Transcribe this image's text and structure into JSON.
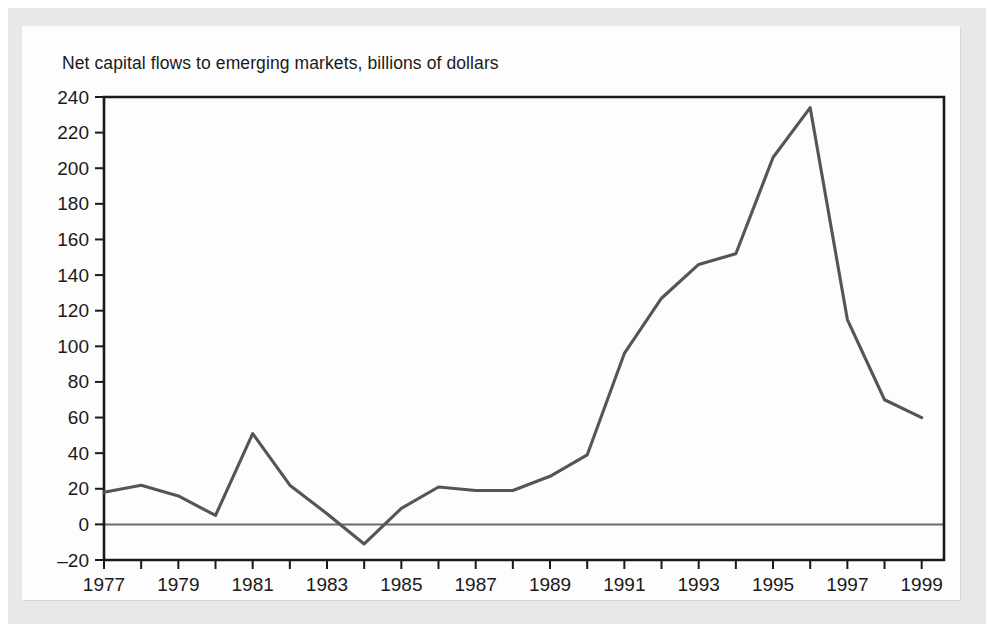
{
  "chart_data": {
    "type": "line",
    "title": "Net capital flows to emerging markets, billions of dollars",
    "xlabel": "",
    "ylabel": "",
    "xlim": [
      1977,
      1999.6
    ],
    "ylim": [
      -20,
      240
    ],
    "ytick_step": 20,
    "xtick_step": 1,
    "xlabel_step": 2,
    "grid": false,
    "legend": false,
    "zero_line": true,
    "line_color": "#555555",
    "axis_color": "#1a1a1a",
    "yticks": [
      -20,
      0,
      20,
      40,
      60,
      80,
      100,
      120,
      140,
      160,
      180,
      200,
      220,
      240
    ],
    "ytick_labels": [
      "–20",
      "0",
      "20",
      "40",
      "60",
      "80",
      "100",
      "120",
      "140",
      "160",
      "180",
      "200",
      "220",
      "240"
    ],
    "xticks": [
      1977,
      1978,
      1979,
      1980,
      1981,
      1982,
      1983,
      1984,
      1985,
      1986,
      1987,
      1988,
      1989,
      1990,
      1991,
      1992,
      1993,
      1994,
      1995,
      1996,
      1997,
      1998,
      1999
    ],
    "xtick_labels": [
      "1977",
      "",
      "1979",
      "",
      "1981",
      "",
      "1983",
      "",
      "1985",
      "",
      "1987",
      "",
      "1989",
      "",
      "1991",
      "",
      "1993",
      "",
      "1995",
      "",
      "1997",
      "",
      "1999"
    ],
    "x": [
      1977,
      1978,
      1979,
      1980,
      1981,
      1982,
      1983,
      1984,
      1985,
      1986,
      1987,
      1988,
      1989,
      1990,
      1991,
      1992,
      1993,
      1994,
      1995,
      1996,
      1997,
      1998,
      1999
    ],
    "values": [
      18,
      22,
      16,
      5,
      51,
      22,
      6,
      -11,
      9,
      21,
      19,
      19,
      27,
      39,
      96,
      127,
      146,
      152,
      206,
      234,
      115,
      70,
      60
    ],
    "series": [
      {
        "name": "Net capital flows to emerging markets",
        "values": [
          18,
          22,
          16,
          5,
          51,
          22,
          6,
          -11,
          9,
          21,
          19,
          19,
          27,
          39,
          96,
          127,
          146,
          152,
          206,
          234,
          115,
          70,
          60
        ]
      }
    ]
  }
}
